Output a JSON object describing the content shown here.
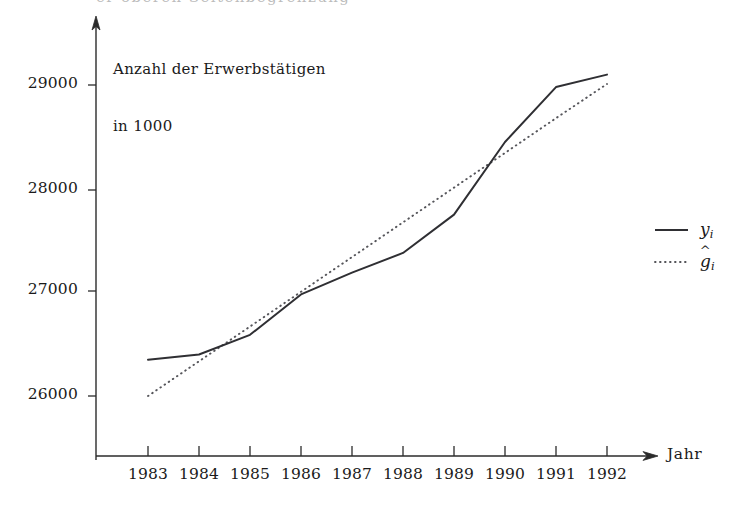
{
  "figure": {
    "width": 732,
    "height": 521,
    "background": "#ffffff",
    "ink_color": "#2f2f33",
    "top_bleed_text": "er oberen Seitenbegrenzung"
  },
  "axes": {
    "y_axis_title_line1": "Anzahl der Erwerbstätigen",
    "y_axis_title_line2": "in 1000",
    "x_axis_name": "Jahr",
    "y_tick_labels": [
      "29000",
      "28000",
      "27000",
      "26000"
    ],
    "x_tick_labels": [
      "1983",
      "1984",
      "1985",
      "1986",
      "1987",
      "1988",
      "1989",
      "1990",
      "1991",
      "1992"
    ]
  },
  "legend": {
    "entries": [
      {
        "label_base": "y",
        "label_sub": "i",
        "hat": "",
        "style": "solid",
        "name": "observed"
      },
      {
        "label_base": "g",
        "label_sub": "i",
        "hat": "^",
        "style": "dotted",
        "name": "fitted"
      }
    ]
  },
  "chart_data": {
    "type": "line",
    "title": "",
    "subtitle": "",
    "xlabel": "Jahr",
    "ylabel": "Anzahl der Erwerbstätigen in 1000",
    "x": [
      1983,
      1984,
      1985,
      1986,
      1987,
      1988,
      1989,
      1990,
      1991,
      1992
    ],
    "xtick_labels": [
      "1983",
      "1984",
      "1985",
      "1986",
      "1987",
      "1988",
      "1989",
      "1990",
      "1991",
      "1992"
    ],
    "ytick_values": [
      26000,
      27000,
      28000,
      29000
    ],
    "ylim": [
      25450,
      29350
    ],
    "xlim": [
      1982.5,
      1992.8
    ],
    "grid": false,
    "legend_position": "right",
    "series": [
      {
        "name": "y_i",
        "label": "yi",
        "style": "solid",
        "color": "#2f2f33",
        "values": [
          26350,
          26400,
          26590,
          26980,
          27190,
          27380,
          27750,
          28450,
          28980,
          29100
        ]
      },
      {
        "name": "g_hat_i",
        "label": "ĝi",
        "style": "dotted",
        "color": "#55555a",
        "values": [
          26000,
          26335,
          26670,
          27005,
          27340,
          27675,
          28010,
          28345,
          28680,
          29010
        ]
      }
    ]
  }
}
